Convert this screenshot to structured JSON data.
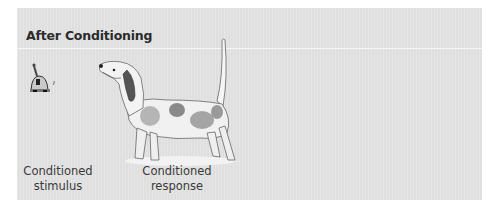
{
  "figure": {
    "title": "After Conditioning",
    "labels": {
      "stimulus": [
        "Conditioned",
        "stimulus"
      ],
      "response": [
        "Conditioned",
        "response"
      ]
    },
    "illustrations": [
      "bell-icon",
      "dog-illustration"
    ],
    "colors": {
      "panel_bg": "#e3e3e3",
      "text": "#2b2b2b",
      "divider": "#f6f6f6"
    }
  }
}
